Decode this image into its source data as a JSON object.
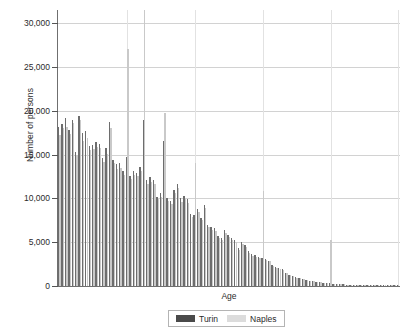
{
  "chart_data": {
    "type": "bar",
    "title": "",
    "subtitle": "",
    "xlabel": "Age",
    "ylabel": "Number of persons",
    "ylim": [
      0,
      31500
    ],
    "xlim": [
      0,
      101
    ],
    "grid": "both",
    "legend_position": "bottom",
    "ytick_labels": [
      "0",
      "5,000",
      "10,000",
      "15,000",
      "20,000",
      "25,000",
      "30,000"
    ],
    "ytick_values": [
      0,
      5000,
      10000,
      15000,
      20000,
      25000,
      30000
    ],
    "vertical_gridline_ages": [
      20,
      40,
      60,
      80,
      100
    ],
    "categories": [
      0,
      1,
      2,
      3,
      4,
      5,
      6,
      7,
      8,
      9,
      10,
      11,
      12,
      13,
      14,
      15,
      16,
      17,
      18,
      19,
      20,
      21,
      22,
      23,
      24,
      25,
      26,
      27,
      28,
      29,
      30,
      31,
      32,
      33,
      34,
      35,
      36,
      37,
      38,
      39,
      40,
      41,
      42,
      43,
      44,
      45,
      46,
      47,
      48,
      49,
      50,
      51,
      52,
      53,
      54,
      55,
      56,
      57,
      58,
      59,
      60,
      61,
      62,
      63,
      64,
      65,
      66,
      67,
      68,
      69,
      70,
      71,
      72,
      73,
      74,
      75,
      76,
      77,
      78,
      79,
      80,
      81,
      82,
      83,
      84,
      85,
      86,
      87,
      88,
      89,
      90,
      91,
      92,
      93,
      94,
      95,
      96,
      97,
      98,
      99,
      100
    ],
    "series": [
      {
        "name": "Turin",
        "color": "#6d6d6d",
        "values": [
          18100,
          18500,
          19200,
          17800,
          19000,
          15300,
          19400,
          17500,
          17700,
          16000,
          16100,
          16400,
          16200,
          14600,
          15800,
          18700,
          14400,
          13900,
          14000,
          13100,
          14700,
          12600,
          13100,
          12900,
          13600,
          19000,
          12100,
          12400,
          12100,
          10200,
          10600,
          16500,
          10100,
          9700,
          11000,
          11600,
          10000,
          10300,
          9900,
          8200,
          8100,
          8800,
          7800,
          9300,
          7000,
          6700,
          6600,
          5700,
          5500,
          6400,
          5800,
          5500,
          5200,
          4300,
          5000,
          4700,
          4000,
          3600,
          3500,
          3300,
          3200,
          3100,
          2900,
          2400,
          2200,
          2000,
          1900,
          1500,
          1300,
          1150,
          1000,
          900,
          820,
          700,
          620,
          560,
          500,
          430,
          380,
          330,
          300,
          270,
          240,
          210,
          180,
          160,
          140,
          120,
          105,
          90,
          80,
          70,
          60,
          50,
          42,
          36,
          30,
          25,
          20,
          16,
          12
        ]
      },
      {
        "name": "Naples",
        "color": "#c9c9c9",
        "values": [
          17200,
          18000,
          18100,
          17400,
          18600,
          14900,
          19000,
          16500,
          16900,
          15500,
          15600,
          15900,
          15800,
          14200,
          15100,
          18000,
          14000,
          13400,
          13500,
          12700,
          27000,
          12200,
          12700,
          12500,
          13100,
          31500,
          11700,
          11900,
          11700,
          9900,
          10200,
          19700,
          9700,
          9400,
          10600,
          11200,
          9600,
          9900,
          9500,
          7900,
          14000,
          8400,
          7500,
          8900,
          6700,
          6400,
          6300,
          5500,
          5300,
          6100,
          5600,
          5300,
          5000,
          4100,
          4800,
          4500,
          3800,
          3400,
          3300,
          3200,
          10800,
          3000,
          2800,
          2300,
          2100,
          1950,
          1850,
          1450,
          1250,
          1100,
          950,
          870,
          790,
          670,
          600,
          540,
          480,
          410,
          360,
          320,
          5200,
          260,
          230,
          200,
          175,
          155,
          135,
          115,
          100,
          88,
          78,
          68,
          58,
          48,
          40,
          34,
          28,
          24,
          19,
          15,
          11
        ]
      }
    ],
    "legend": [
      {
        "label": "Turin",
        "color": "#4a4a4a"
      },
      {
        "label": "Naples",
        "color": "#dcdcdc"
      }
    ]
  }
}
